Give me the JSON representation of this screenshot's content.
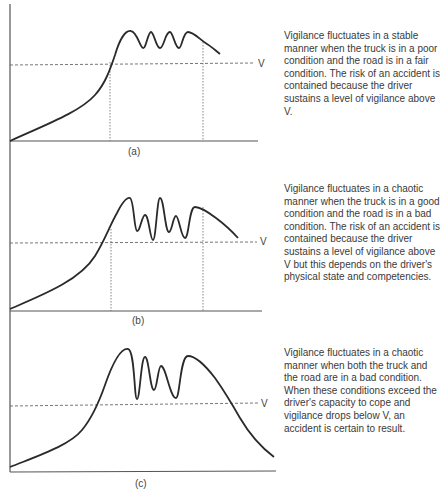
{
  "figure": {
    "threshold_label": "V",
    "panels": [
      {
        "id": "a",
        "label": "(a)",
        "caption": "Vigilance fluctuates in a stable manner when the truck is in a poor condition and the road is in a fair condition. The risk of an accident is contained because the driver sustains a level of vigilance above V."
      },
      {
        "id": "b",
        "label": "(b)",
        "caption": "Vigilance fluctuates in a chaotic manner when the truck is in a good condition and the road is in a bad condition. The risk of an accident is contained because the driver sustains a level of vigilance above V but this depends on the driver's physical state and competencies."
      },
      {
        "id": "c",
        "label": "(c)",
        "caption": "Vigilance fluctuates in a chaotic manner when both the truck and the road are in a bad condition. When these conditions exceed the driver's capacity to cope and vigilance drops below V, an accident is certain to result."
      }
    ]
  },
  "colors": {
    "curve": "#2a2a2a",
    "axis": "#555555",
    "guide": "#666666",
    "text": "#3a3a3a"
  }
}
